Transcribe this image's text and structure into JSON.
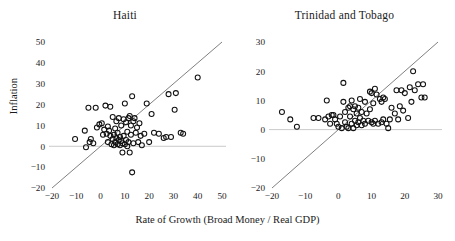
{
  "figure": {
    "xlabel": "Rate of Growth (Broad Money / Real GDP)",
    "ylabel": "Inflation"
  },
  "chart_data": [
    {
      "type": "scatter",
      "title": "Haiti",
      "xlabel": "Rate of Growth (Broad Money / Real GDP)",
      "ylabel": "Inflation",
      "xlim": [
        -20,
        50
      ],
      "ylim": [
        -20,
        50
      ],
      "xticks": [
        -20,
        -10,
        0,
        10,
        20,
        30,
        40,
        50
      ],
      "yticks": [
        -20,
        -10,
        0,
        10,
        20,
        30,
        40,
        50
      ],
      "grid": false,
      "legend": null,
      "reference_lines": [
        {
          "name": "zero-inflation-line",
          "type": "horizontal",
          "y": 0,
          "color": "#bdbdbd"
        },
        {
          "name": "forty-five-degree-line",
          "type": "diagonal",
          "slope": 1,
          "intercept": 0,
          "color": "#555555"
        }
      ],
      "marker": "open-circle",
      "points": [
        [
          -10.5,
          3.5
        ],
        [
          -6.5,
          7.5
        ],
        [
          -6.0,
          -0.5
        ],
        [
          -5.0,
          18.5
        ],
        [
          -4.5,
          2.0
        ],
        [
          -4.0,
          3.5
        ],
        [
          -3.0,
          1.5
        ],
        [
          -2.0,
          18.5
        ],
        [
          -1.5,
          9.0
        ],
        [
          -0.5,
          10.5
        ],
        [
          0.5,
          11.0
        ],
        [
          1.0,
          5.5
        ],
        [
          1.5,
          8.0
        ],
        [
          2.0,
          19.5
        ],
        [
          2.5,
          6.0
        ],
        [
          3.0,
          9.5
        ],
        [
          3.0,
          2.0
        ],
        [
          3.5,
          7.5
        ],
        [
          4.0,
          19.0
        ],
        [
          4.0,
          5.0
        ],
        [
          4.5,
          1.0
        ],
        [
          5.0,
          14.0
        ],
        [
          5.0,
          3.5
        ],
        [
          5.5,
          5.5
        ],
        [
          5.5,
          0.5
        ],
        [
          6.0,
          8.5
        ],
        [
          6.0,
          2.0
        ],
        [
          6.5,
          12.0
        ],
        [
          6.5,
          4.0
        ],
        [
          7.0,
          1.0
        ],
        [
          7.0,
          6.5
        ],
        [
          7.5,
          3.0
        ],
        [
          7.5,
          13.5
        ],
        [
          8.0,
          0.5
        ],
        [
          8.0,
          4.5
        ],
        [
          8.5,
          2.5
        ],
        [
          8.5,
          10.0
        ],
        [
          9.0,
          1.5
        ],
        [
          9.0,
          -3.0
        ],
        [
          9.5,
          5.0
        ],
        [
          9.5,
          13.0
        ],
        [
          10.0,
          1.0
        ],
        [
          10.0,
          20.5
        ],
        [
          10.5,
          3.0
        ],
        [
          10.5,
          11.5
        ],
        [
          11.0,
          0.0
        ],
        [
          11.0,
          7.0
        ],
        [
          11.5,
          13.5
        ],
        [
          11.5,
          2.0
        ],
        [
          12.0,
          14.5
        ],
        [
          12.0,
          -3.0
        ],
        [
          12.5,
          10.0
        ],
        [
          12.5,
          5.5
        ],
        [
          13.0,
          24.0
        ],
        [
          13.0,
          -12.5
        ],
        [
          13.5,
          12.0
        ],
        [
          13.5,
          1.5
        ],
        [
          14.0,
          13.5
        ],
        [
          14.5,
          6.5
        ],
        [
          15.0,
          9.0
        ],
        [
          15.5,
          2.0
        ],
        [
          16.0,
          11.0
        ],
        [
          16.5,
          5.0
        ],
        [
          17.0,
          0.5
        ],
        [
          18.0,
          6.0
        ],
        [
          19.0,
          20.5
        ],
        [
          20.0,
          2.0
        ],
        [
          21.0,
          15.5
        ],
        [
          22.0,
          6.5
        ],
        [
          24.0,
          6.0
        ],
        [
          26.0,
          4.0
        ],
        [
          27.0,
          4.5
        ],
        [
          28.0,
          25.0
        ],
        [
          29.0,
          4.5
        ],
        [
          30.5,
          17.5
        ],
        [
          31.0,
          25.5
        ],
        [
          33.0,
          6.5
        ],
        [
          34.0,
          6.0
        ],
        [
          40.0,
          33.0
        ]
      ]
    },
    {
      "type": "scatter",
      "title": "Trinidad and Tobago",
      "xlabel": "Rate of Growth (Broad Money / Real GDP)",
      "ylabel": "Inflation",
      "xlim": [
        -20,
        30
      ],
      "ylim": [
        -20,
        30
      ],
      "xticks": [
        -20,
        -10,
        0,
        10,
        20,
        30
      ],
      "yticks": [
        -20,
        -10,
        0,
        10,
        20,
        30
      ],
      "grid": false,
      "legend": null,
      "reference_lines": [
        {
          "name": "zero-inflation-line",
          "type": "horizontal",
          "y": 0,
          "color": "#bdbdbd"
        },
        {
          "name": "forty-five-degree-line",
          "type": "diagonal",
          "slope": 1,
          "intercept": 0,
          "color": "#555555"
        }
      ],
      "marker": "open-circle",
      "points": [
        [
          -17.0,
          6.0
        ],
        [
          -14.5,
          3.5
        ],
        [
          -12.5,
          1.0
        ],
        [
          -7.5,
          4.0
        ],
        [
          -6.0,
          4.0
        ],
        [
          -4.0,
          3.5
        ],
        [
          -3.5,
          10.0
        ],
        [
          -3.0,
          4.5
        ],
        [
          -2.5,
          2.0
        ],
        [
          -2.0,
          5.0
        ],
        [
          -1.5,
          5.0
        ],
        [
          -1.0,
          3.5
        ],
        [
          -0.5,
          2.0
        ],
        [
          0.0,
          1.0
        ],
        [
          0.5,
          4.5
        ],
        [
          1.0,
          0.5
        ],
        [
          1.5,
          9.5
        ],
        [
          1.5,
          16.0
        ],
        [
          2.0,
          2.5
        ],
        [
          2.0,
          6.0
        ],
        [
          2.5,
          1.0
        ],
        [
          3.0,
          7.5
        ],
        [
          3.0,
          0.5
        ],
        [
          3.5,
          4.5
        ],
        [
          3.5,
          8.0
        ],
        [
          4.0,
          2.0
        ],
        [
          4.0,
          10.0
        ],
        [
          4.5,
          7.0
        ],
        [
          4.5,
          0.5
        ],
        [
          5.0,
          8.0
        ],
        [
          5.0,
          3.0
        ],
        [
          5.5,
          5.5
        ],
        [
          5.5,
          1.5
        ],
        [
          6.0,
          7.5
        ],
        [
          6.0,
          2.5
        ],
        [
          6.5,
          10.5
        ],
        [
          6.5,
          4.0
        ],
        [
          7.0,
          1.5
        ],
        [
          7.0,
          6.0
        ],
        [
          7.5,
          3.0
        ],
        [
          8.0,
          9.5
        ],
        [
          8.0,
          2.0
        ],
        [
          8.5,
          5.5
        ],
        [
          9.0,
          3.0
        ],
        [
          9.5,
          13.0
        ],
        [
          9.5,
          7.0
        ],
        [
          10.0,
          2.5
        ],
        [
          10.0,
          12.5
        ],
        [
          10.5,
          9.0
        ],
        [
          10.5,
          2.0
        ],
        [
          11.0,
          14.0
        ],
        [
          11.0,
          3.0
        ],
        [
          11.5,
          12.0
        ],
        [
          12.0,
          2.0
        ],
        [
          12.5,
          10.5
        ],
        [
          13.0,
          9.5
        ],
        [
          13.0,
          2.5
        ],
        [
          13.5,
          11.0
        ],
        [
          13.5,
          3.5
        ],
        [
          14.0,
          10.5
        ],
        [
          14.5,
          2.0
        ],
        [
          15.0,
          0.5
        ],
        [
          15.5,
          3.5
        ],
        [
          16.0,
          7.5
        ],
        [
          17.0,
          5.5
        ],
        [
          17.5,
          13.5
        ],
        [
          18.0,
          3.5
        ],
        [
          18.5,
          8.0
        ],
        [
          19.0,
          13.5
        ],
        [
          19.5,
          6.5
        ],
        [
          20.0,
          12.5
        ],
        [
          21.0,
          4.0
        ],
        [
          21.5,
          14.5
        ],
        [
          22.0,
          9.5
        ],
        [
          22.5,
          20.0
        ],
        [
          23.0,
          13.5
        ],
        [
          24.0,
          15.5
        ],
        [
          25.0,
          11.0
        ],
        [
          25.5,
          15.5
        ],
        [
          26.0,
          11.0
        ]
      ]
    }
  ]
}
